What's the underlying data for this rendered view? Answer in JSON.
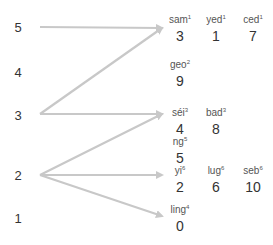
{
  "colors": {
    "arrow": "#c8c8c8",
    "text": "#333333",
    "syllable": "#555555"
  },
  "tones": [
    {
      "label": "5",
      "x": 18,
      "y": 27
    },
    {
      "label": "4",
      "x": 18,
      "y": 72
    },
    {
      "label": "3",
      "x": 18,
      "y": 115
    },
    {
      "label": "2",
      "x": 18,
      "y": 175
    },
    {
      "label": "1",
      "x": 18,
      "y": 218
    }
  ],
  "arrows": [
    {
      "from": "5",
      "to": "sam",
      "x1": 40,
      "y1": 27,
      "x2": 162,
      "y2": 28
    },
    {
      "from": "3",
      "to": "sam",
      "x1": 40,
      "y1": 114,
      "x2": 162,
      "y2": 28
    },
    {
      "from": "3",
      "to": "séi",
      "x1": 40,
      "y1": 114,
      "x2": 162,
      "y2": 114
    },
    {
      "from": "2",
      "to": "séi",
      "x1": 40,
      "y1": 175,
      "x2": 162,
      "y2": 114
    },
    {
      "from": "2",
      "to": "yi",
      "x1": 40,
      "y1": 175,
      "x2": 162,
      "y2": 175
    },
    {
      "from": "2",
      "to": "ling",
      "x1": 40,
      "y1": 175,
      "x2": 162,
      "y2": 216
    }
  ],
  "entries": [
    {
      "syllable": "sam",
      "tone": "1",
      "number": "3",
      "x": 180,
      "y": 14
    },
    {
      "syllable": "yed",
      "tone": "1",
      "number": "1",
      "x": 216,
      "y": 14
    },
    {
      "syllable": "ced",
      "tone": "1",
      "number": "7",
      "x": 253,
      "y": 14
    },
    {
      "syllable": "geo",
      "tone": "2",
      "number": "9",
      "x": 180,
      "y": 59
    },
    {
      "syllable": "séi",
      "tone": "3",
      "number": "4",
      "x": 180,
      "y": 107
    },
    {
      "syllable": "bad",
      "tone": "3",
      "number": "8",
      "x": 216,
      "y": 107
    },
    {
      "syllable": "ng",
      "tone": "5",
      "number": "5",
      "x": 180,
      "y": 136
    },
    {
      "syllable": "yi",
      "tone": "6",
      "number": "2",
      "x": 180,
      "y": 165
    },
    {
      "syllable": "lug",
      "tone": "6",
      "number": "6",
      "x": 216,
      "y": 165
    },
    {
      "syllable": "seb",
      "tone": "6",
      "number": "10",
      "x": 253,
      "y": 165
    },
    {
      "syllable": "ling",
      "tone": "4",
      "number": "0",
      "x": 180,
      "y": 204
    }
  ]
}
